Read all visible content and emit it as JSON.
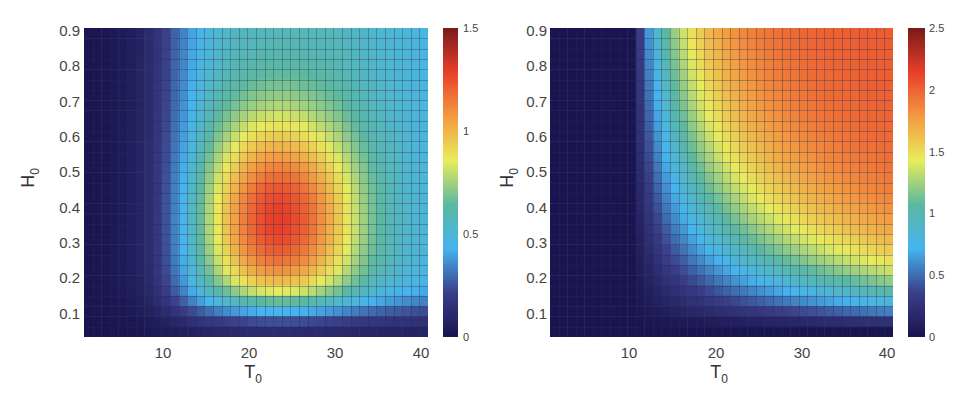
{
  "chart_data": [
    {
      "type": "heatmap",
      "title": "",
      "xlabel": "T0",
      "ylabel": "H0",
      "xlim": [
        0.5,
        40.5
      ],
      "ylim": [
        0.03,
        0.9
      ],
      "x_ticks": [
        10,
        20,
        30,
        40
      ],
      "y_ticks": [
        0.1,
        0.2,
        0.3,
        0.4,
        0.5,
        0.6,
        0.7,
        0.8,
        0.9
      ],
      "grid": true,
      "colormap": "jet-like (parula-style muted)",
      "colorbar": {
        "min": 0,
        "max": 1.5,
        "ticks": [
          0,
          0.5,
          1,
          1.5
        ]
      },
      "description": "Value rises from ~0 at small T0 or small H0; peak ~1.3 near T0≈22-25, H0≈0.3-0.45; decreases toward ~0.6 at T0=40, H0=0.9",
      "peak": {
        "T0": 23,
        "H0": 0.35,
        "value": 1.3
      },
      "samples": [
        {
          "T0": 5,
          "H0": 0.5,
          "value": 0.05
        },
        {
          "T0": 10,
          "H0": 0.5,
          "value": 0.55
        },
        {
          "T0": 15,
          "H0": 0.8,
          "value": 0.85
        },
        {
          "T0": 20,
          "H0": 0.8,
          "value": 0.9
        },
        {
          "T0": 30,
          "H0": 0.8,
          "value": 0.7
        },
        {
          "T0": 40,
          "H0": 0.9,
          "value": 0.5
        },
        {
          "T0": 20,
          "H0": 0.4,
          "value": 1.2
        },
        {
          "T0": 25,
          "H0": 0.3,
          "value": 1.3
        },
        {
          "T0": 30,
          "H0": 0.2,
          "value": 0.95
        },
        {
          "T0": 40,
          "H0": 0.3,
          "value": 0.7
        },
        {
          "T0": 30,
          "H0": 0.05,
          "value": 0.2
        },
        {
          "T0": 15,
          "H0": 0.1,
          "value": 0.3
        }
      ]
    },
    {
      "type": "heatmap",
      "title": "",
      "xlabel": "T0",
      "ylabel": "H0",
      "xlim": [
        0.5,
        40.5
      ],
      "ylim": [
        0.03,
        0.9
      ],
      "x_ticks": [
        10,
        20,
        30,
        40
      ],
      "y_ticks": [
        0.1,
        0.2,
        0.3,
        0.4,
        0.5,
        0.6,
        0.7,
        0.8,
        0.9
      ],
      "grid": true,
      "colormap": "jet-like (parula-style muted)",
      "colorbar": {
        "min": 0,
        "max": 2.5,
        "ticks": [
          0,
          0.5,
          1,
          1.5,
          2,
          2.5
        ]
      },
      "description": "Value ~0 for T0<10 or H0<0.1; increases monotonically with T0 and H0; plateau ~1.9-2.0 for T0>25, H0>0.4",
      "peak": {
        "T0": 40,
        "H0": 0.7,
        "value": 2.0
      },
      "samples": [
        {
          "T0": 5,
          "H0": 0.5,
          "value": 0.0
        },
        {
          "T0": 12,
          "H0": 0.8,
          "value": 0.4
        },
        {
          "T0": 16,
          "H0": 0.8,
          "value": 0.9
        },
        {
          "T0": 20,
          "H0": 0.8,
          "value": 1.3
        },
        {
          "T0": 23,
          "H0": 0.8,
          "value": 1.6
        },
        {
          "T0": 30,
          "H0": 0.7,
          "value": 1.9
        },
        {
          "T0": 40,
          "H0": 0.6,
          "value": 2.0
        },
        {
          "T0": 35,
          "H0": 0.3,
          "value": 1.5
        },
        {
          "T0": 35,
          "H0": 0.2,
          "value": 1.0
        },
        {
          "T0": 35,
          "H0": 0.1,
          "value": 0.5
        },
        {
          "T0": 20,
          "H0": 0.2,
          "value": 0.5
        },
        {
          "T0": 10,
          "H0": 0.1,
          "value": 0.0
        }
      ]
    }
  ],
  "left": {
    "y_ticks": [
      "0.9",
      "0.8",
      "0.7",
      "0.6",
      "0.5",
      "0.4",
      "0.3",
      "0.2",
      "0.1"
    ],
    "x_ticks": [
      "10",
      "20",
      "30",
      "40"
    ],
    "xlabel": "T",
    "xlabel_sub": "0",
    "ylabel": "H",
    "ylabel_sub": "0",
    "cbar_ticks": [
      "1.5",
      "1",
      "0.5",
      "0"
    ]
  },
  "right": {
    "y_ticks": [
      "0.9",
      "0.8",
      "0.7",
      "0.6",
      "0.5",
      "0.4",
      "0.3",
      "0.2",
      "0.1"
    ],
    "x_ticks": [
      "10",
      "20",
      "30",
      "40"
    ],
    "xlabel": "T",
    "xlabel_sub": "0",
    "ylabel": "H",
    "ylabel_sub": "0",
    "cbar_ticks": [
      "2.5",
      "2",
      "1.5",
      "1",
      "0.5",
      "0"
    ]
  },
  "colors": {
    "grid_line": "#2a2a50",
    "cmap_stops": [
      "#1a1450",
      "#3a3f8a",
      "#46b4ee",
      "#5bb8a0",
      "#e8ec5a",
      "#f39a40",
      "#e8402a",
      "#7a1a1a"
    ]
  }
}
